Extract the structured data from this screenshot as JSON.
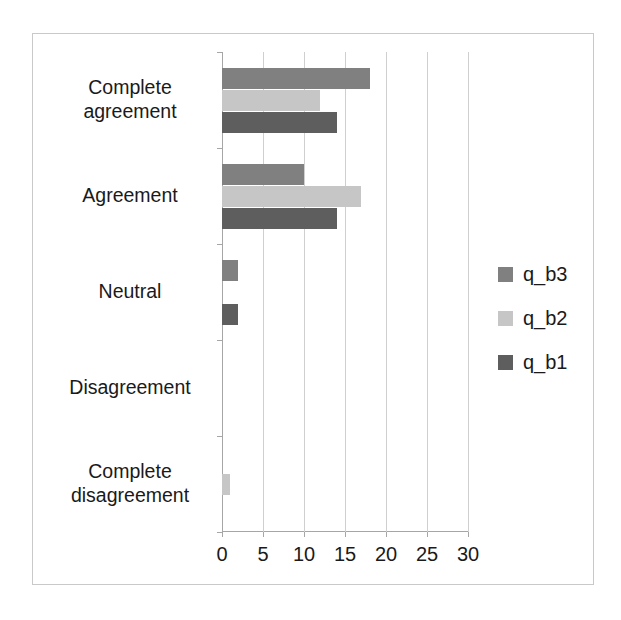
{
  "chart_data": {
    "type": "bar",
    "orientation": "horizontal",
    "title": "",
    "xlabel": "",
    "ylabel": "",
    "xlim": [
      0,
      30
    ],
    "xticks": [
      0,
      5,
      10,
      15,
      20,
      25,
      30
    ],
    "xtick_labels": [
      "0",
      "5",
      "10",
      "15",
      "20",
      "25",
      "30"
    ],
    "grid": "vertical",
    "legend_position": "right",
    "categories": [
      "Complete agreement",
      "Agreement",
      "Neutral",
      "Disagreement",
      "Complete disagreement"
    ],
    "series": [
      {
        "name": "q_b3",
        "color": "#808080",
        "values": [
          18,
          10,
          2,
          0,
          0
        ]
      },
      {
        "name": "q_b2",
        "color": "#c6c6c6",
        "values": [
          12,
          17,
          0,
          0,
          1
        ]
      },
      {
        "name": "q_b1",
        "color": "#5e5e5e",
        "values": [
          14,
          14,
          2,
          0,
          0
        ]
      }
    ]
  },
  "legend": {
    "items": [
      {
        "label": "q_b3",
        "swatch": "#808080"
      },
      {
        "label": "q_b2",
        "swatch": "#c6c6c6"
      },
      {
        "label": "q_b1",
        "swatch": "#5e5e5e"
      }
    ]
  },
  "axis": {
    "category_labels": [
      "Complete agreement",
      "Agreement",
      "Neutral",
      "Disagreement",
      "Complete disagreement"
    ],
    "value_labels": [
      "0",
      "5",
      "10",
      "15",
      "20",
      "25",
      "30"
    ]
  }
}
